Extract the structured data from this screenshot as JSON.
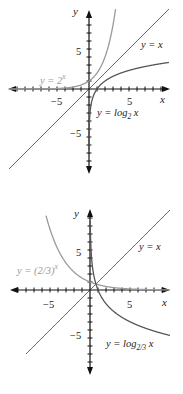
{
  "chart_data": [
    {
      "type": "line",
      "title": "",
      "xlabel": "x",
      "ylabel": "y",
      "xlim": [
        -10,
        10
      ],
      "ylim": [
        -10,
        10
      ],
      "grid": false,
      "xticks_labeled": [
        -5,
        5
      ],
      "yticks_labeled": [
        5,
        -5
      ],
      "series": [
        {
          "name": "y = 2^x",
          "label": "y = 2",
          "label_exp": "x",
          "color": "#9a9a9a",
          "function": "2^x"
        },
        {
          "name": "y = x",
          "label": "y = x",
          "color": "#1a1a1a",
          "function": "x"
        },
        {
          "name": "y = log_2 x",
          "label": "y = log",
          "label_sub": "2",
          "label_tail": " x",
          "color": "#555555",
          "function": "log2(x)"
        }
      ]
    },
    {
      "type": "line",
      "title": "",
      "xlabel": "x",
      "ylabel": "y",
      "xlim": [
        -10,
        10
      ],
      "ylim": [
        -10,
        10
      ],
      "grid": false,
      "xticks_labeled": [
        -5,
        5
      ],
      "yticks_labeled": [
        5,
        -5
      ],
      "series": [
        {
          "name": "y = (2/3)^x",
          "label": "y = (2/3)",
          "label_exp": "x",
          "color": "#9a9a9a",
          "function": "(2/3)^x"
        },
        {
          "name": "y = x",
          "label": "y = x",
          "color": "#1a1a1a",
          "function": "x"
        },
        {
          "name": "y = log_{2/3} x",
          "label": "y = log",
          "label_sub": "2/3",
          "label_tail": " x",
          "color": "#555555",
          "function": "log_{2/3}(x)"
        }
      ]
    }
  ],
  "plots": [
    {
      "axis_x_label": "x",
      "axis_y_label": "y",
      "tick_neg5": "−5",
      "tick_pos5": "5",
      "ytick_pos5": "5",
      "ytick_neg5": "−5",
      "exp_label": "y = 2",
      "exp_label_sup": "x",
      "identity_label": "y = x",
      "log_label": "y = log",
      "log_label_sub": "2",
      "log_label_tail": " x"
    },
    {
      "axis_x_label": "x",
      "axis_y_label": "y",
      "tick_neg5": "−5",
      "tick_pos5": "5",
      "ytick_pos5": "5",
      "ytick_neg5": "−5",
      "exp_label": "y = (2/3)",
      "exp_label_sup": "x",
      "identity_label": "y = x",
      "log_label": "y = log",
      "log_label_sub": "2/3",
      "log_label_tail": " x"
    }
  ]
}
